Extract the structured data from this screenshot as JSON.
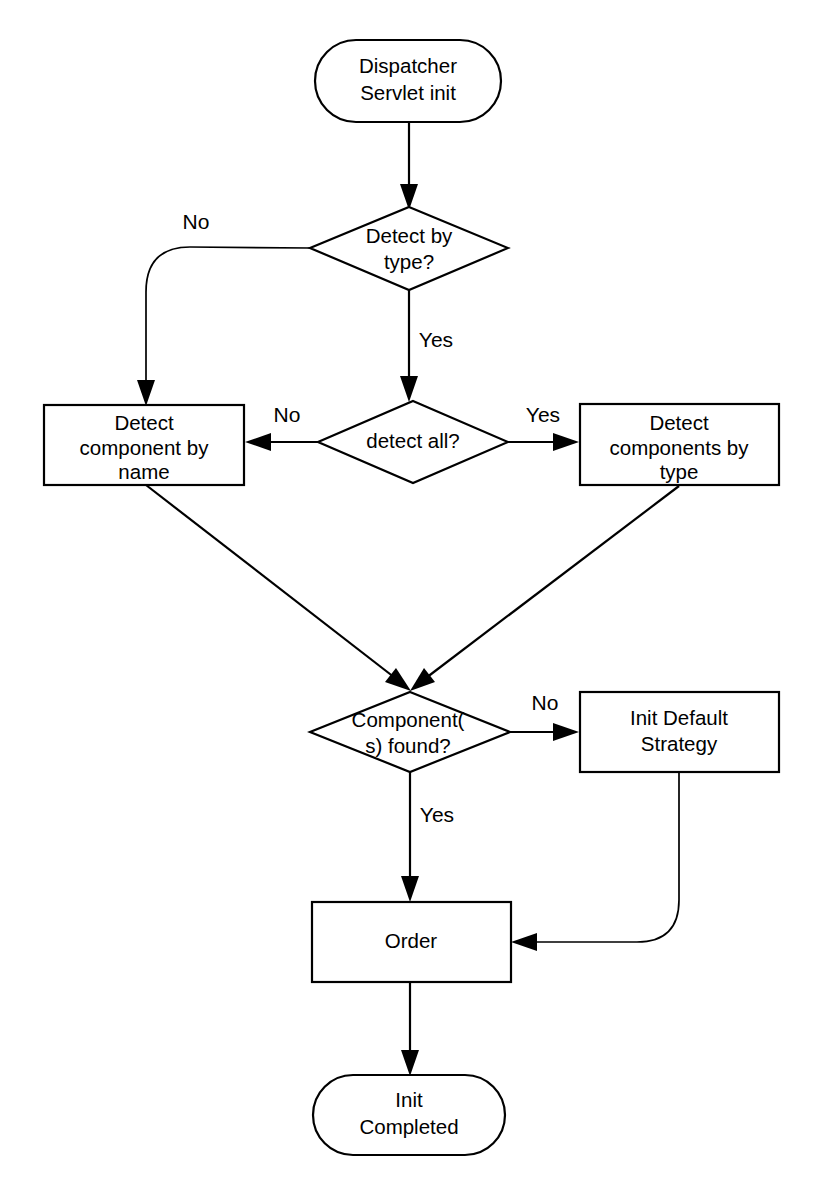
{
  "diagram": {
    "background_color": "#ffffff",
    "line_color": "#000000",
    "nodes": {
      "start": {
        "id": "start",
        "shape": "terminator",
        "line1": "Dispatcher",
        "line2": "Servlet init"
      },
      "detect_by_type": {
        "id": "detect_by_type",
        "shape": "decision",
        "line1": "Detect by",
        "line2": "type?"
      },
      "detect_all": {
        "id": "detect_all",
        "shape": "decision",
        "line1": "detect all?",
        "line2": ""
      },
      "detect_component_by_name": {
        "id": "detect_component_by_name",
        "shape": "process",
        "line1": "Detect",
        "line2": "component by",
        "line3": "name"
      },
      "detect_components_by_type": {
        "id": "detect_components_by_type",
        "shape": "process",
        "line1": "Detect",
        "line2": "components by",
        "line3": "type"
      },
      "components_found": {
        "id": "components_found",
        "shape": "decision",
        "line1": "Component(",
        "line2": "s) found?"
      },
      "init_default_strategy": {
        "id": "init_default_strategy",
        "shape": "process",
        "line1": "Init Default",
        "line2": "Strategy"
      },
      "order": {
        "id": "order",
        "shape": "process",
        "line1": "Order",
        "line2": "",
        "line3": ""
      },
      "end": {
        "id": "end",
        "shape": "terminator",
        "line1": "Init",
        "line2": "Completed"
      }
    },
    "edge_labels": {
      "detect_by_type_no": "No",
      "detect_by_type_yes": "Yes",
      "detect_all_no": "No",
      "detect_all_yes": "Yes",
      "components_found_no": "No",
      "components_found_yes": "Yes"
    }
  }
}
